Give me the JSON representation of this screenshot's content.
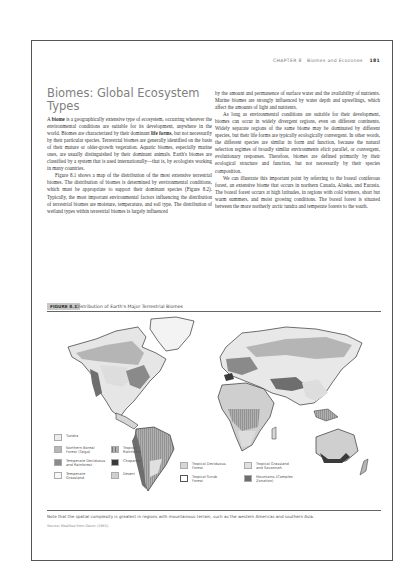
{
  "header": {
    "chapter": "CHAPTER 8",
    "chapter_title": "Biomes and Ecozones",
    "page_number": "181"
  },
  "section": {
    "title": "Biomes: Global Ecosystem Types"
  },
  "left_column": {
    "p1_prefix": "A ",
    "p1_term": "biome",
    "p1_a": " is a geographically extensive type of ecosystem, occurring wherever the environmental conditions are suitable for its development, anywhere in the world. Biomes are characterized by their dominant ",
    "p1_term2": "life forms",
    "p1_b": ", but not necessarily by their particular species. Terrestrial biomes are generally identified on the basis of their mature or older-growth vegetation. Aquatic biomes, especially marine ones, are usually distinguished by their dominant animals. Earth's biomes are classified by a system that is used internationally—that is, by ecologists working in many countries.",
    "p2": "Figure 8.1 shows a map of the distribution of the most extensive terrestrial biomes. The distribution of biomes is determined by environmental conditions, which must be appropriate to support their dominant species (Figure 8.2). Typically, the most important environmental factors influencing the distribution of terrestrial biomes are moisture, temperature, and soil type. The distribution of wetland types within terrestrial biomes is largely influenced"
  },
  "right_column": {
    "p1": "by the amount and permanence of surface water and the availability of nutrients. Marine biomes are strongly influenced by water depth and upwellings, which affect the amounts of light and nutrients.",
    "p2": "As long as environmental conditions are suitable for their development, biomes can occur in widely divergent regions, even on different continents. Widely separate regions of the same biome may be dominated by different species, but their life forms are typically ecologically convergent. In other words, the different species are similar in form and function, because the natural selection regimes of broadly similar environments elicit parallel, or convergent, evolutionary responses. Therefore, biomes are defined primarily by their ecological structure and function, but not necessarily by their species composition.",
    "p3": "We can illustrate this important point by referring to the boreal coniferous forest, an extensive biome that occurs in northern Canada, Alaska, and Eurasia. The boreal forest occurs at high latitudes, in regions with cold winters, short but warm summers, and moist growing conditions. The boreal forest is situated between the more northerly arctic tundra and temperate forests to the south."
  },
  "figure": {
    "label": "FIGURE 8.1",
    "title": "Distribution of Earth's Major Terrestrial Biomes",
    "legend": [
      {
        "label": "Tundra",
        "color": "#ececec",
        "pattern": "plain"
      },
      {
        "label": "Northern Boreal Forest (Taiga)",
        "color": "#b8b8b8",
        "pattern": "plain"
      },
      {
        "label": "Temperate Deciduous and Rainforest",
        "color": "#8a8a8a",
        "pattern": "plain"
      },
      {
        "label": "Temperate Grassland",
        "color": "#f7f7f7",
        "pattern": "plain"
      },
      {
        "label": "Tropical Rainforest",
        "color": "#a8a8a8",
        "pattern": "vertical-lines"
      },
      {
        "label": "Chaparral",
        "color": "#3a3a3a",
        "pattern": "plain"
      },
      {
        "label": "Desert",
        "color": "#cfcfcf",
        "pattern": "plain"
      },
      {
        "label": "Tropical Deciduous Forest",
        "color": "#d6d6d6",
        "pattern": "dots"
      },
      {
        "label": "Tropical Scrub Forest",
        "color": "#ffffff",
        "pattern": "outline"
      },
      {
        "label": "Tropical Grassland and Savannah",
        "color": "#e0e0e0",
        "pattern": "dots"
      },
      {
        "label": "Mountains (Complex Zonation)",
        "color": "#6e6e6e",
        "pattern": "plain"
      }
    ],
    "note": "Note that the spatial complexity is greatest in regions with mountainous terrain, such as the western Americas and southern Asia.",
    "source": "Source: Modified from Odum (1983)."
  }
}
